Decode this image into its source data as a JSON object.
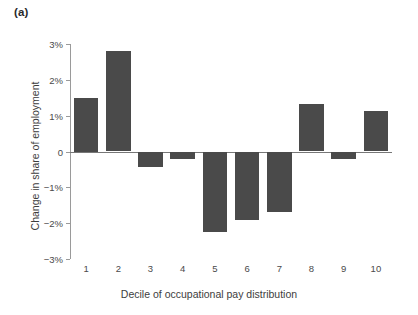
{
  "panel": {
    "label": "(a)"
  },
  "chart_data": {
    "type": "bar",
    "title": "",
    "subtitle": "",
    "xlabel": "Decile of occupational pay distribution",
    "ylabel": "Change in share of employment",
    "categories": [
      "1",
      "2",
      "3",
      "4",
      "5",
      "6",
      "7",
      "8",
      "9",
      "10"
    ],
    "values": [
      1.5,
      2.8,
      -0.42,
      -0.2,
      -2.25,
      -1.9,
      -1.7,
      1.32,
      -0.22,
      1.12
    ],
    "ylim": [
      -3,
      3
    ],
    "ytick_values": [
      3,
      2,
      1,
      0,
      -1,
      -2,
      -3
    ],
    "ytick_labels": [
      "3%",
      "2%",
      "1%",
      "0",
      "-1%",
      "-2%",
      "-3%"
    ],
    "grid": false,
    "legend": null,
    "bar_color": "#4a4a4a",
    "axis_color": "#9a9a9a",
    "background_color": "#ffffff",
    "annotations": []
  }
}
